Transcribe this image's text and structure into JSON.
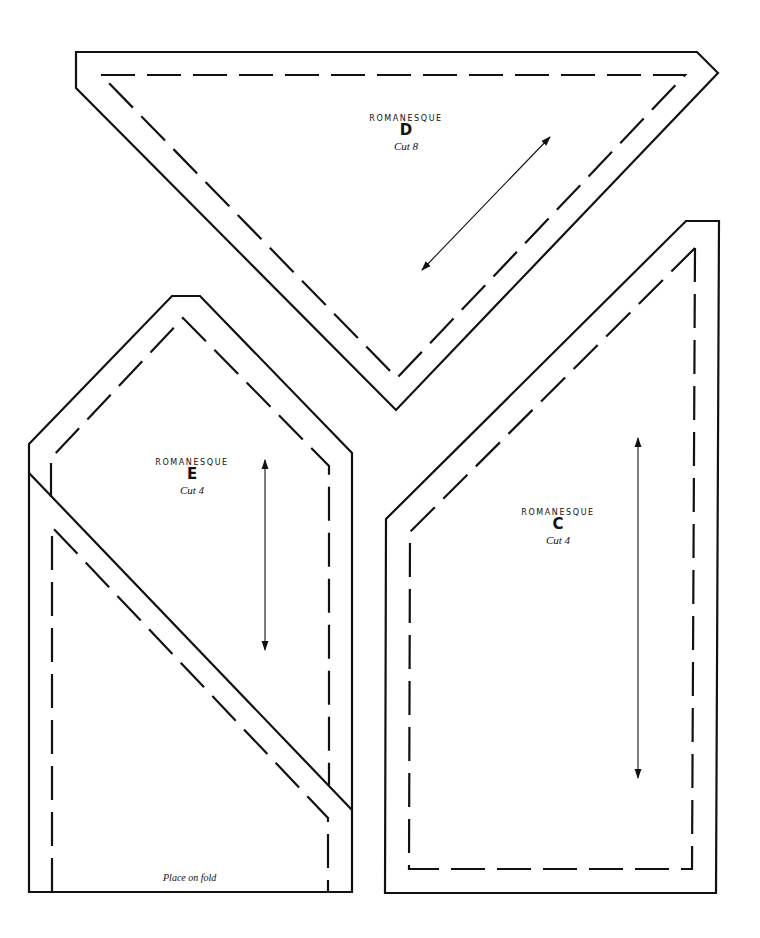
{
  "page": {
    "colors": {
      "line": "#111111",
      "background": "#ffffff"
    }
  },
  "pieces": [
    {
      "id": "D",
      "pattern_name": "ROMANESQUE",
      "letter": "D",
      "cut_instruction": "Cut 8",
      "grain_arrow": "diagonal"
    },
    {
      "id": "E",
      "pattern_name": "ROMANESQUE",
      "letter": "E",
      "cut_instruction": "Cut 4",
      "grain_arrow": "vertical",
      "fold_note": "Place on fold"
    },
    {
      "id": "C",
      "pattern_name": "ROMANESQUE",
      "letter": "C",
      "cut_instruction": "Cut 4",
      "grain_arrow": "vertical"
    }
  ],
  "legend": {
    "solid_line": "cutting-line",
    "dashed_line": "sewing-line",
    "double_arrow": "grain-line-arrow"
  }
}
